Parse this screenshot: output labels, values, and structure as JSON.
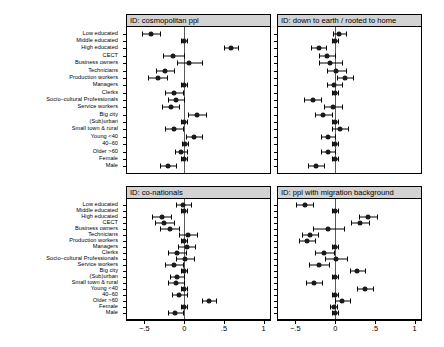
{
  "figure": {
    "categories": [
      "Low educated",
      "Middle educated",
      "High educated",
      "CECT",
      "Business owners",
      "Technicians",
      "Production workers",
      "Managers",
      "Clerks",
      "Socio–cultural Professionals",
      "Service workers",
      "Big city",
      "(Sub)urban",
      "Small town & rural",
      "Young <40",
      "40–60",
      "Older >60",
      "Female",
      "Male"
    ],
    "x_axis": {
      "ticks": [
        -0.5,
        0,
        0.5,
        1
      ],
      "tick_labels": [
        "−.5",
        "0",
        ".5",
        "1"
      ],
      "min": -0.72,
      "max": 1.08
    },
    "reference_line": 0,
    "colors": {
      "header_fill": "#d3d3d3",
      "frame": "#000000",
      "point": "#1a1a1a",
      "zero_line": "#5a5a5a"
    }
  },
  "chart_data": [
    {
      "type": "scatter",
      "title": "ID: cosmopolitan ppl",
      "panel": "top-left",
      "xlabel": "",
      "ylabel": "",
      "xlim": [
        -0.72,
        1.08
      ],
      "grid": false,
      "legend": "none",
      "categories": [
        "Low educated",
        "Middle educated",
        "High educated",
        "CECT",
        "Business owners",
        "Technicians",
        "Production workers",
        "Managers",
        "Clerks",
        "Socio–cultural Professionals",
        "Service workers",
        "Big city",
        "(Sub)urban",
        "Small town & rural",
        "Young <40",
        "40–60",
        "Older >60",
        "Female",
        "Male"
      ],
      "estimates": [
        -0.42,
        0.0,
        0.59,
        -0.14,
        0.06,
        -0.24,
        -0.33,
        0.0,
        -0.13,
        -0.1,
        -0.17,
        0.16,
        0.0,
        -0.13,
        0.12,
        0.01,
        -0.04,
        0.0,
        -0.2
      ],
      "ci_low": [
        -0.53,
        -0.04,
        0.5,
        -0.27,
        -0.09,
        -0.35,
        -0.45,
        -0.04,
        -0.24,
        -0.2,
        -0.28,
        0.05,
        -0.04,
        -0.24,
        0.02,
        -0.03,
        -0.12,
        -0.04,
        -0.3
      ],
      "ci_high": [
        -0.31,
        0.04,
        0.68,
        0.0,
        0.22,
        -0.13,
        -0.22,
        0.04,
        -0.02,
        0.0,
        -0.06,
        0.27,
        0.04,
        -0.02,
        0.23,
        0.05,
        0.04,
        0.04,
        -0.1
      ]
    },
    {
      "type": "scatter",
      "title": "ID: down to earth / rooted to home",
      "panel": "top-right",
      "xlabel": "",
      "ylabel": "",
      "xlim": [
        -0.72,
        1.08
      ],
      "grid": false,
      "legend": "none",
      "categories": [
        "Low educated",
        "Middle educated",
        "High educated",
        "CECT",
        "Business owners",
        "Technicians",
        "Production workers",
        "Managers",
        "Clerks",
        "Socio–cultural Professionals",
        "Service workers",
        "Big city",
        "(Sub)urban",
        "Small town & rural",
        "Young <40",
        "40–60",
        "Older >60",
        "Female",
        "Male"
      ],
      "estimates": [
        0.05,
        0.0,
        -0.21,
        -0.1,
        -0.06,
        0.01,
        0.12,
        -0.01,
        0.0,
        -0.28,
        -0.03,
        -0.15,
        0.0,
        0.06,
        -0.09,
        0.0,
        -0.09,
        0.0,
        -0.24
      ],
      "ci_low": [
        -0.03,
        -0.04,
        -0.31,
        -0.21,
        -0.2,
        -0.1,
        0.02,
        -0.1,
        -0.04,
        -0.39,
        -0.14,
        -0.26,
        -0.04,
        -0.04,
        -0.18,
        -0.04,
        -0.18,
        -0.04,
        -0.34
      ],
      "ci_high": [
        0.14,
        0.04,
        -0.12,
        0.0,
        0.09,
        0.13,
        0.23,
        0.09,
        0.04,
        -0.18,
        0.09,
        -0.04,
        0.04,
        0.16,
        0.0,
        0.04,
        0.0,
        0.04,
        -0.14
      ]
    },
    {
      "type": "scatter",
      "title": "ID: co-nationals",
      "panel": "bottom-left",
      "xlabel": "",
      "ylabel": "",
      "xlim": [
        -0.72,
        1.08
      ],
      "grid": false,
      "legend": "none",
      "categories": [
        "Low educated",
        "Middle educated",
        "High educated",
        "CECT",
        "Business owners",
        "Technicians",
        "Production workers",
        "Managers",
        "Clerks",
        "Socio–cultural Professionals",
        "Service workers",
        "Big city",
        "(Sub)urban",
        "Small town & rural",
        "Young <40",
        "40–60",
        "Older >60",
        "Female",
        "Male"
      ],
      "estimates": [
        -0.01,
        0.0,
        -0.28,
        -0.25,
        -0.18,
        0.05,
        0.0,
        0.03,
        -0.09,
        0.01,
        -0.13,
        0.0,
        -0.09,
        -0.1,
        0.0,
        -0.06,
        0.31,
        0.0,
        -0.11
      ],
      "ci_low": [
        -0.1,
        -0.04,
        -0.4,
        -0.37,
        -0.3,
        -0.06,
        -0.04,
        -0.08,
        -0.2,
        -0.1,
        -0.24,
        -0.04,
        -0.18,
        -0.2,
        -0.04,
        -0.15,
        0.22,
        -0.04,
        -0.2
      ],
      "ci_high": [
        0.08,
        0.04,
        -0.16,
        -0.13,
        -0.06,
        0.16,
        0.04,
        0.14,
        0.02,
        0.12,
        -0.02,
        0.04,
        0.0,
        0.0,
        0.04,
        0.03,
        0.4,
        0.04,
        -0.02
      ]
    },
    {
      "type": "scatter",
      "title": "ID: ppl with migration background",
      "panel": "bottom-right",
      "xlabel": "",
      "ylabel": "",
      "xlim": [
        -0.72,
        1.08
      ],
      "grid": false,
      "legend": "none",
      "categories": [
        "Low educated",
        "Middle educated",
        "High educated",
        "CECT",
        "Business owners",
        "Technicians",
        "Production workers",
        "Managers",
        "Clerks",
        "Socio–cultural Professionals",
        "Service workers",
        "Big city",
        "(Sub)urban",
        "Small town & rural",
        "Young <40",
        "40–60",
        "Older >60",
        "Female",
        "Male"
      ],
      "estimates": [
        -0.38,
        0.0,
        0.41,
        0.31,
        -0.09,
        -0.32,
        -0.36,
        0.0,
        -0.14,
        0.01,
        -0.2,
        0.28,
        0.0,
        -0.27,
        0.38,
        0.0,
        0.09,
        -0.02,
        0.0
      ],
      "ci_low": [
        -0.49,
        -0.04,
        0.3,
        0.2,
        -0.28,
        -0.42,
        -0.46,
        -0.04,
        -0.26,
        -0.13,
        -0.33,
        0.18,
        -0.04,
        -0.37,
        0.28,
        -0.04,
        0.0,
        -0.06,
        -0.04
      ],
      "ci_high": [
        -0.28,
        0.04,
        0.52,
        0.42,
        0.11,
        -0.22,
        -0.26,
        0.04,
        -0.02,
        0.15,
        -0.08,
        0.38,
        0.04,
        -0.17,
        0.48,
        0.04,
        0.19,
        0.02,
        0.04
      ]
    }
  ]
}
